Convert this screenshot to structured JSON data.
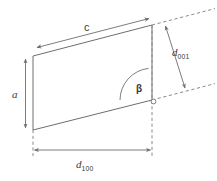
{
  "figure": {
    "name": "unit-cell-lattice-spacing-diagram",
    "background_color": "#ffffff",
    "line_color": "#6e6e6e",
    "text_color": "#3a3a3a"
  },
  "labels": {
    "edge_c": "c",
    "edge_a": "a",
    "angle_beta": "β",
    "d001_base": "d",
    "d001_sub": "001",
    "d100_base": "d",
    "d100_sub": "100"
  },
  "geometry": {
    "parallelogram": {
      "top_left": [
        33,
        56
      ],
      "top_right": [
        152,
        25
      ],
      "bottom_right": [
        152,
        100
      ],
      "bottom_left": [
        33,
        130
      ]
    },
    "c_arrow": {
      "from": [
        36,
        47
      ],
      "to": [
        150,
        17
      ]
    },
    "a_arrow": {
      "from": [
        25,
        57
      ],
      "to": [
        25,
        130
      ]
    },
    "d100_arrow": {
      "from": [
        33,
        150
      ],
      "to": [
        152,
        150
      ]
    },
    "d001_arrow": {
      "from": [
        164,
        24
      ],
      "to": [
        186,
        90
      ]
    },
    "dashed_upper": {
      "from": [
        152,
        25
      ],
      "to": [
        214,
        9
      ]
    },
    "dashed_lower": {
      "from": [
        152,
        100
      ],
      "to": [
        214,
        84
      ]
    },
    "dashed_vertical_right": {
      "from": [
        152,
        25
      ],
      "to": [
        152,
        155
      ]
    },
    "dashed_vertical_left": {
      "from": [
        33,
        130
      ],
      "to": [
        33,
        155
      ]
    },
    "angle_arc_radius": 32,
    "corner_marker": {
      "center": [
        153,
        101
      ],
      "radius": 2.4
    }
  }
}
